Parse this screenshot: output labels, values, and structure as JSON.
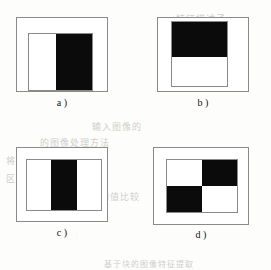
{
  "figure": {
    "background_color": "#fdfdfc",
    "line_color": "#8a8a8a",
    "fill_black": "#0b0b0b",
    "fill_white": "#ffffff",
    "panels": [
      {
        "id": "a",
        "label": "a )",
        "description": "Inner rectangle split into two vertical halves: left white, right black",
        "split": "vertical",
        "cells": [
          {
            "name": "left-half",
            "fill": "white"
          },
          {
            "name": "right-half",
            "fill": "black"
          }
        ]
      },
      {
        "id": "b",
        "label": "b )",
        "description": "Inner rectangle split into two horizontal halves: top black, bottom white",
        "split": "horizontal",
        "cells": [
          {
            "name": "top-half",
            "fill": "black"
          },
          {
            "name": "bottom-half",
            "fill": "white"
          }
        ]
      },
      {
        "id": "c",
        "label": "c )",
        "description": "Inner rectangle split into three vertical bands: white, black centre band, white",
        "split": "vertical-thirds",
        "cells": [
          {
            "name": "left-band",
            "fill": "white"
          },
          {
            "name": "centre-band",
            "fill": "black"
          },
          {
            "name": "right-band",
            "fill": "white"
          }
        ]
      },
      {
        "id": "d",
        "label": "d )",
        "description": "Inner rectangle split into a 2 by 2 checkerboard",
        "split": "quadrants",
        "cells": [
          {
            "name": "top-left",
            "fill": "white"
          },
          {
            "name": "top-right",
            "fill": "black"
          },
          {
            "name": "bottom-left",
            "fill": "black"
          },
          {
            "name": "bottom-right",
            "fill": "white"
          }
        ]
      }
    ]
  },
  "showthrough": {
    "line1": "输入图像的",
    "line2": "的图像处理方法",
    "line3": "将图像分割成若干个",
    "line4": "区域的灰度值与",
    "line5": "均值比较",
    "line6": "基于块的图像特征提取",
    "line7": "特征描述子"
  }
}
